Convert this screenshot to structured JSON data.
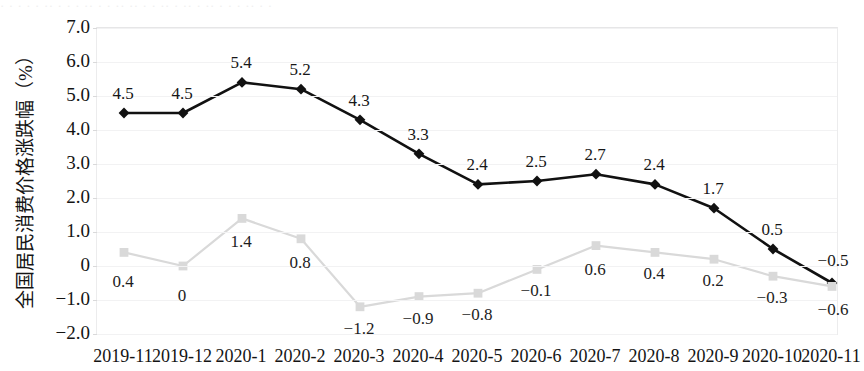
{
  "top_fragment": "· · ·  · ·  ·· ·  ·  · ·· · ·  ·· ·· ·  · ·· · ·· ·  ·· · · · ·· ·  ·",
  "axis": {
    "y_title": "全国居民消费价格涨跌幅（%）",
    "y_ticks": [
      "7.0",
      "6.0",
      "5.0",
      "4.0",
      "3.0",
      "2.0",
      "1.0",
      "0",
      "-1.0",
      "-2.0"
    ]
  },
  "chart_data": {
    "type": "line",
    "title": "",
    "xlabel": "",
    "ylabel": "全国居民消费价格涨跌幅（%）",
    "ylim": [
      -2.0,
      7.0
    ],
    "ytick_values": [
      7.0,
      6.0,
      5.0,
      4.0,
      3.0,
      2.0,
      1.0,
      0,
      -1.0,
      -2.0
    ],
    "ytick_labels": [
      "7.0",
      "6.0",
      "5.0",
      "4.0",
      "3.0",
      "2.0",
      "1.0",
      "0",
      "-1.0",
      "-2.0"
    ],
    "grid": true,
    "legend": "none",
    "categories": [
      "2019-11",
      "2019-12",
      "2020-1",
      "2020-2",
      "2020-3",
      "2020-4",
      "2020-5",
      "2020-6",
      "2020-7",
      "2020-8",
      "2020-9",
      "2020-10",
      "2020-11"
    ],
    "series": [
      {
        "name": "food-series-dark",
        "color": "#111111",
        "marker": "diamond",
        "label_position": "above",
        "values": [
          4.5,
          4.5,
          5.4,
          5.2,
          4.3,
          3.3,
          2.4,
          2.5,
          2.7,
          2.4,
          1.7,
          0.5,
          -0.5
        ],
        "labels": [
          "4.5",
          "4.5",
          "5.4",
          "5.2",
          "4.3",
          "3.3",
          "2.4",
          "2.5",
          "2.7",
          "2.4",
          "1.7",
          "0.5",
          "-0.5"
        ]
      },
      {
        "name": "nonfood-series-light",
        "color": "#d9d9d9",
        "marker": "square",
        "label_position": "below",
        "values": [
          0.4,
          0,
          1.4,
          0.8,
          -1.2,
          -0.9,
          -0.8,
          -0.1,
          0.6,
          0.4,
          0.2,
          -0.3,
          -0.6
        ],
        "labels": [
          "0.4",
          "0",
          "1.4",
          "0.8",
          "-1.2",
          "-0.9",
          "-0.8",
          "-0.1",
          "0.6",
          "0.4",
          "0.2",
          "-0.3",
          "-0.6"
        ]
      }
    ]
  }
}
